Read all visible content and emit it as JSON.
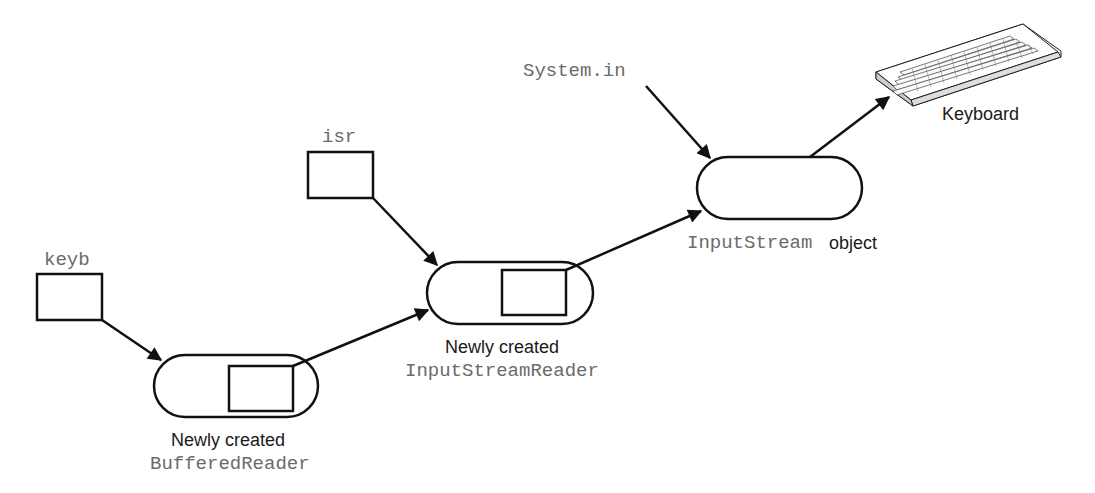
{
  "diagram": {
    "variables": {
      "keyb": "keyb",
      "isr": "isr",
      "system_in": "System.in"
    },
    "objects": {
      "buffered_reader": {
        "caption_line1": "Newly created",
        "caption_line2": "BufferedReader"
      },
      "input_stream_reader": {
        "caption_line1": "Newly created",
        "caption_line2": "InputStreamReader"
      },
      "input_stream": {
        "caption_code": "InputStream",
        "caption_text": "object"
      }
    },
    "device": {
      "label": "Keyboard",
      "icon": "keyboard-icon"
    },
    "colors": {
      "stroke": "#111111",
      "code_text": "#6b6b6b",
      "plain_text": "#1a1a1a"
    }
  }
}
